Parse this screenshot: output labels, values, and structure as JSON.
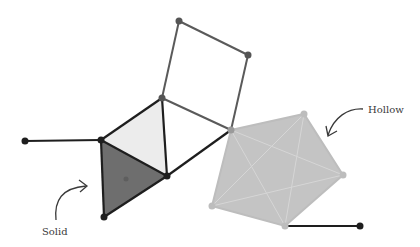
{
  "diagram": {
    "labels": {
      "solid": "Solid",
      "hollow": "Hollow"
    },
    "colors": {
      "solid_fill": "#6e6e6e",
      "light_fill": "#ececec",
      "hollow_fill": "#c4c4c4",
      "hollow_inner_line": "#d8d8d8",
      "edge_dark": "#1e1e1e",
      "edge_gray": "#5a5a5a",
      "vertex_dark": "#1e1e1e",
      "vertex_gray": "#555555",
      "vertex_hollow": "#bdbdbd"
    },
    "vertices": {
      "left_end": [
        25,
        141
      ],
      "square_top": [
        179,
        21
      ],
      "square_right": [
        248,
        55
      ],
      "mid_top": [
        162,
        98
      ],
      "junction": [
        231,
        130
      ],
      "tri_left": [
        101,
        140
      ],
      "tri_right": [
        167,
        176
      ],
      "tri_bottom": [
        104,
        217
      ],
      "tri_center": [
        126,
        179
      ],
      "pent_b": [
        304,
        114
      ],
      "pent_c": [
        343,
        175
      ],
      "pent_d": [
        285,
        226
      ],
      "pent_e": [
        212,
        206
      ],
      "right_end": [
        360,
        226
      ]
    }
  }
}
